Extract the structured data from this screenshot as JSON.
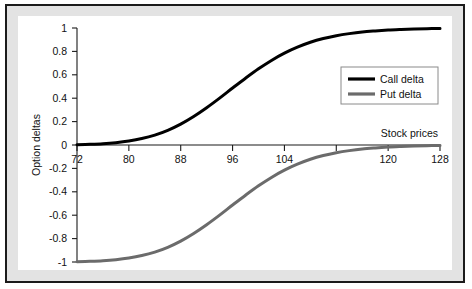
{
  "chart_data": {
    "type": "line",
    "title": "",
    "xlabel": "Stock prices",
    "ylabel": "Option deltas",
    "xlim": [
      72,
      128
    ],
    "ylim": [
      -1,
      1
    ],
    "grid": false,
    "legend_position": "right-upper",
    "x_ticks": [
      72,
      80,
      88,
      96,
      104,
      112,
      120,
      128
    ],
    "x_tick_labels": [
      "72",
      "80",
      "88",
      "96",
      "104",
      "",
      "120",
      "128"
    ],
    "y_ticks": [
      1,
      0.8,
      0.6,
      0.4,
      0.2,
      0,
      -0.2,
      -0.4,
      -0.6,
      -0.8,
      -1
    ],
    "y_tick_labels": [
      "1",
      "0.8",
      "0.6",
      "0.4",
      "0.2",
      "0",
      "-0.2",
      "-0.4",
      "-0.6",
      "-0.8",
      "-1"
    ],
    "x": [
      72,
      74,
      76,
      78,
      80,
      82,
      84,
      86,
      88,
      90,
      92,
      94,
      96,
      98,
      100,
      102,
      104,
      106,
      108,
      110,
      112,
      114,
      116,
      118,
      120,
      122,
      124,
      126,
      128
    ],
    "series": [
      {
        "name": "Call delta",
        "color": "#000000",
        "width": 3.0,
        "values": [
          0.003,
          0.006,
          0.011,
          0.02,
          0.034,
          0.055,
          0.085,
          0.126,
          0.179,
          0.244,
          0.319,
          0.401,
          0.487,
          0.571,
          0.651,
          0.723,
          0.785,
          0.836,
          0.878,
          0.91,
          0.934,
          0.952,
          0.966,
          0.975,
          0.982,
          0.987,
          0.991,
          0.994,
          0.996
        ]
      },
      {
        "name": "Put delta",
        "color": "#6b6b6b",
        "width": 3.0,
        "values": [
          -0.997,
          -0.994,
          -0.989,
          -0.98,
          -0.966,
          -0.945,
          -0.915,
          -0.874,
          -0.821,
          -0.756,
          -0.681,
          -0.599,
          -0.513,
          -0.429,
          -0.349,
          -0.277,
          -0.215,
          -0.164,
          -0.122,
          -0.09,
          -0.066,
          -0.048,
          -0.034,
          -0.025,
          -0.018,
          -0.013,
          -0.009,
          -0.006,
          -0.004
        ]
      }
    ],
    "legend": [
      {
        "label": "Call delta",
        "color": "#000000"
      },
      {
        "label": "Put delta",
        "color": "#6b6b6b"
      }
    ]
  },
  "axis_labels": {
    "x_title": "Stock prices",
    "y_title": "Option deltas"
  }
}
